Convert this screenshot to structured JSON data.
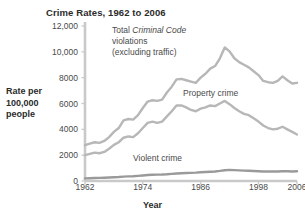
{
  "chart_data": {
    "type": "line",
    "title": "Crime Rates, 1962 to 2006",
    "xlabel": "Year",
    "ylabel": "Rate per\n100,000\npeople",
    "ylabel_lines": [
      "Rate per",
      "100,000",
      "people"
    ],
    "xlim": [
      1962,
      2006
    ],
    "ylim": [
      0,
      12000
    ],
    "grid": false,
    "legend_position": "inline-annotations",
    "ytick_values": [
      0,
      2000,
      4000,
      6000,
      8000,
      10000,
      12000
    ],
    "ytick_labels": [
      "0",
      "2000",
      "4000",
      "6000",
      "8000",
      "10,000",
      "12,000"
    ],
    "xtick_values": [
      1962,
      1974,
      1986,
      1998,
      2006
    ],
    "xtick_labels": [
      "1962",
      "1974",
      "1986",
      "1998",
      "2006"
    ],
    "x": [
      1962,
      1963,
      1964,
      1965,
      1966,
      1967,
      1968,
      1969,
      1970,
      1971,
      1972,
      1973,
      1974,
      1975,
      1976,
      1977,
      1978,
      1979,
      1980,
      1981,
      1982,
      1983,
      1984,
      1985,
      1986,
      1987,
      1988,
      1989,
      1990,
      1991,
      1992,
      1993,
      1994,
      1995,
      1996,
      1997,
      1998,
      1999,
      2000,
      2001,
      2002,
      2003,
      2004,
      2005,
      2006
    ],
    "series": [
      {
        "name": "Total Criminal Code violations (excluding traffic)",
        "color": "#b7b7b7",
        "values": [
          2771,
          2900,
          3000,
          2950,
          3100,
          3400,
          3800,
          4100,
          4700,
          4800,
          4750,
          5100,
          5650,
          6150,
          6250,
          6200,
          6300,
          6850,
          7300,
          7870,
          7900,
          7800,
          7700,
          7600,
          8000,
          8300,
          8700,
          8900,
          9500,
          10340,
          10040,
          9500,
          9200,
          9000,
          8800,
          8500,
          8200,
          7750,
          7650,
          7600,
          7750,
          8100,
          7800,
          7550,
          7600
        ]
      },
      {
        "name": "Property crime",
        "color": "#b7b7b7",
        "values": [
          2000,
          2100,
          2200,
          2150,
          2250,
          2500,
          2800,
          3000,
          3350,
          3450,
          3400,
          3700,
          4100,
          4500,
          4600,
          4500,
          4600,
          5000,
          5400,
          5850,
          5850,
          5700,
          5500,
          5400,
          5600,
          5700,
          5850,
          5800,
          6000,
          6200,
          5950,
          5650,
          5400,
          5200,
          5100,
          4850,
          4600,
          4300,
          4100,
          4000,
          4050,
          4200,
          4000,
          3800,
          3600
        ]
      },
      {
        "name": "Violent crime",
        "color": "#9a9a9a",
        "values": [
          200,
          215,
          230,
          240,
          255,
          270,
          290,
          310,
          340,
          360,
          370,
          400,
          430,
          460,
          480,
          490,
          500,
          520,
          550,
          580,
          600,
          620,
          630,
          650,
          680,
          700,
          720,
          740,
          780,
          830,
          860,
          840,
          820,
          800,
          790,
          780,
          760,
          740,
          740,
          730,
          740,
          760,
          750,
          740,
          750
        ]
      }
    ],
    "annotations": [
      {
        "id": "note-total",
        "lines": [
          "Total ",
          "violations",
          "(excluding traffic)"
        ],
        "line1_prefix": "Total ",
        "line1_italic": "Criminal Code",
        "line2": "violations",
        "line3": "(excluding traffic)"
      },
      {
        "id": "note-property",
        "text": "Property crime"
      },
      {
        "id": "note-violent",
        "text": "Violent crime"
      }
    ]
  },
  "colors": {
    "background": "#ffffff",
    "axis": "#c9c9c9",
    "text": "#3b3b3b",
    "title": "#2b2b2b",
    "line_light": "#b7b7b7",
    "line_dark": "#9a9a9a"
  }
}
